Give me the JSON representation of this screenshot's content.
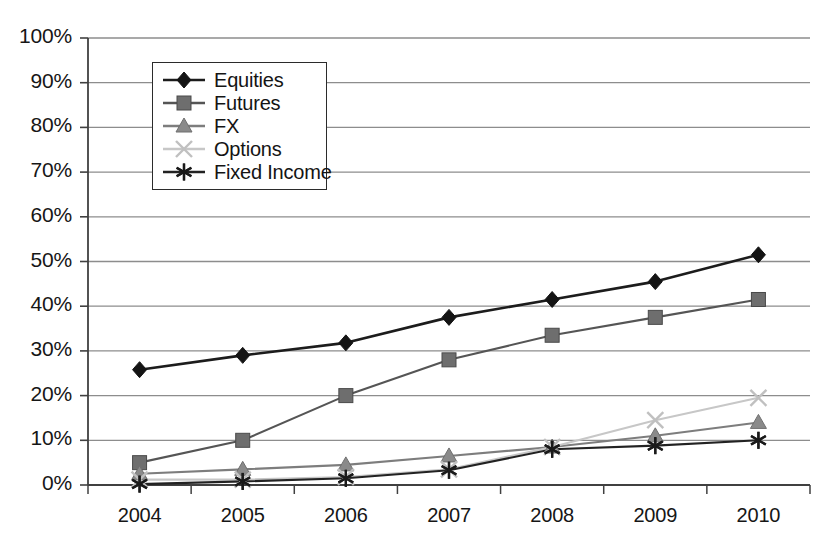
{
  "chart_data": {
    "type": "line",
    "title": "",
    "xlabel": "",
    "ylabel": "",
    "categories": [
      "2004",
      "2005",
      "2006",
      "2007",
      "2008",
      "2009",
      "2010"
    ],
    "x": [
      2004,
      2005,
      2006,
      2007,
      2008,
      2009,
      2010
    ],
    "ylim": [
      0,
      100
    ],
    "y_tick_labels": [
      "0%",
      "10%",
      "20%",
      "30%",
      "40%",
      "50%",
      "60%",
      "70%",
      "80%",
      "90%",
      "100%"
    ],
    "y_ticks": [
      0,
      10,
      20,
      30,
      40,
      50,
      60,
      70,
      80,
      90,
      100
    ],
    "grid": "horizontal",
    "legend_position": "upper-left-inside",
    "series": [
      {
        "name": "Equities",
        "marker": "diamond",
        "color": "#141414",
        "line_color": "#1c1c1c",
        "values": [
          25.8,
          29.0,
          31.8,
          37.5,
          41.5,
          45.5,
          51.5
        ]
      },
      {
        "name": "Futures",
        "marker": "square",
        "color": "#6e6e6e",
        "line_color": "#555555",
        "values": [
          5.0,
          10.0,
          20.0,
          28.0,
          33.5,
          37.5,
          41.5
        ]
      },
      {
        "name": "FX",
        "marker": "triangle",
        "color": "#8a8a8a",
        "line_color": "#7d7d7d",
        "values": [
          2.5,
          3.5,
          4.5,
          6.5,
          8.5,
          11.0,
          14.0
        ]
      },
      {
        "name": "Options",
        "marker": "cross-x",
        "color": "#c0c0c0",
        "line_color": "#c7c7c7",
        "values": [
          1.2,
          1.2,
          1.8,
          3.5,
          8.5,
          14.5,
          19.5
        ]
      },
      {
        "name": "Fixed Income",
        "marker": "asterisk",
        "color": "#1a1a1a",
        "line_color": "#222222",
        "values": [
          0.2,
          0.8,
          1.5,
          3.3,
          8.0,
          8.8,
          10.0
        ]
      }
    ]
  },
  "axis": {
    "y_labels": [
      "100%",
      "90%",
      "80%",
      "70%",
      "60%",
      "50%",
      "40%",
      "30%",
      "20%",
      "10%",
      "0%"
    ],
    "x_labels": [
      "2004",
      "2005",
      "2006",
      "2007",
      "2008",
      "2009",
      "2010"
    ]
  },
  "legend": {
    "entries": [
      {
        "label": "Equities"
      },
      {
        "label": "Futures"
      },
      {
        "label": "FX"
      },
      {
        "label": "Options"
      },
      {
        "label": "Fixed Income"
      }
    ]
  },
  "colors": {
    "equities": "#141414",
    "futures": "#6e6e6e",
    "fx": "#8a8a8a",
    "options": "#c0c0c0",
    "fixed_income": "#1a1a1a",
    "grid": "#8d8d8d",
    "axis": "#404040",
    "background": "#ffffff"
  }
}
